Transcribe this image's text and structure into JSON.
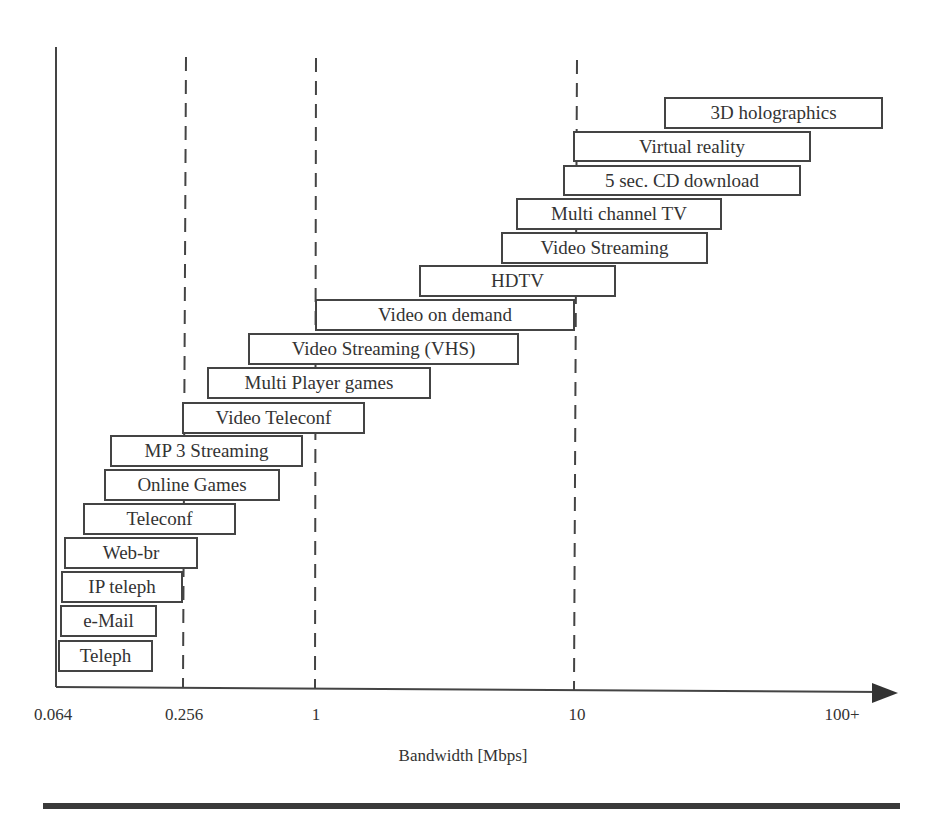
{
  "chart_data": {
    "type": "bar",
    "orientation": "horizontal-range",
    "title": "",
    "xlabel": "Bandwidth [Mbps]",
    "ylabel": "",
    "x_scale": "log",
    "x_ticks": [
      "0.064",
      "0.256",
      "1",
      "10",
      "100+"
    ],
    "reference_lines": [
      "0.256",
      "1",
      "10"
    ],
    "grid": false,
    "legend": null,
    "categories": [
      "Teleph",
      "e-Mail",
      "IP teleph",
      "Web-br",
      "Teleconf",
      "Online Games",
      "MP 3 Streaming",
      "Video Teleconf",
      "Multi Player games",
      "Video Streaming (VHS)",
      "Video on demand",
      "HDTV",
      "Video Streaming",
      "Multi channel TV",
      "5 sec. CD download",
      "Virtual reality",
      "3D holographics"
    ],
    "ranges_mbps": [
      [
        0.064,
        0.2
      ],
      [
        0.064,
        0.21
      ],
      [
        0.064,
        0.256
      ],
      [
        0.07,
        0.3
      ],
      [
        0.09,
        0.45
      ],
      [
        0.13,
        0.8
      ],
      [
        0.14,
        1.0
      ],
      [
        0.256,
        1.6
      ],
      [
        0.35,
        2.8
      ],
      [
        0.55,
        6.0
      ],
      [
        1,
        10
      ],
      [
        2.5,
        15
      ],
      [
        5,
        30
      ],
      [
        6,
        35
      ],
      [
        9,
        70
      ],
      [
        10,
        80
      ],
      [
        22,
        120
      ]
    ]
  },
  "boxes": [
    {
      "label": "3D holographics",
      "x": 664,
      "y": 97,
      "w": 219,
      "h": 32
    },
    {
      "label": "Virtual reality",
      "x": 573,
      "y": 131,
      "w": 238,
      "h": 31
    },
    {
      "label": "5 sec. CD download",
      "x": 563,
      "y": 165,
      "w": 238,
      "h": 31
    },
    {
      "label": "Multi channel TV",
      "x": 516,
      "y": 198,
      "w": 206,
      "h": 32
    },
    {
      "label": "Video Streaming",
      "x": 501,
      "y": 232,
      "w": 207,
      "h": 32
    },
    {
      "label": "HDTV",
      "x": 419,
      "y": 265,
      "w": 197,
      "h": 32
    },
    {
      "label": "Video on demand",
      "x": 315,
      "y": 299,
      "w": 260,
      "h": 32
    },
    {
      "label": "Video Streaming (VHS)",
      "x": 248,
      "y": 333,
      "w": 271,
      "h": 32
    },
    {
      "label": "Multi Player games",
      "x": 207,
      "y": 367,
      "w": 224,
      "h": 32
    },
    {
      "label": "Video Teleconf",
      "x": 182,
      "y": 402,
      "w": 183,
      "h": 32
    },
    {
      "label": "MP 3 Streaming",
      "x": 110,
      "y": 435,
      "w": 193,
      "h": 32
    },
    {
      "label": "Online Games",
      "x": 104,
      "y": 469,
      "w": 176,
      "h": 32
    },
    {
      "label": "Teleconf",
      "x": 83,
      "y": 503,
      "w": 153,
      "h": 32
    },
    {
      "label": "Web-br",
      "x": 64,
      "y": 537,
      "w": 134,
      "h": 32
    },
    {
      "label": "IP teleph",
      "x": 61,
      "y": 571,
      "w": 122,
      "h": 32
    },
    {
      "label": "e-Mail",
      "x": 60,
      "y": 605,
      "w": 97,
      "h": 32
    },
    {
      "label": "Teleph",
      "x": 58,
      "y": 640,
      "w": 95,
      "h": 32
    }
  ],
  "ticks": [
    {
      "label": "0.064",
      "x": 53
    },
    {
      "label": "0.256",
      "x": 184
    },
    {
      "label": "1",
      "x": 316
    },
    {
      "label": "10",
      "x": 577
    },
    {
      "label": "100+",
      "x": 842
    }
  ],
  "axis": {
    "xlabel": "Bandwidth [Mbps]"
  },
  "colors": {
    "ink": "#444444",
    "text": "#333333",
    "rule": "#3a3a3a",
    "background": "#ffffff"
  }
}
